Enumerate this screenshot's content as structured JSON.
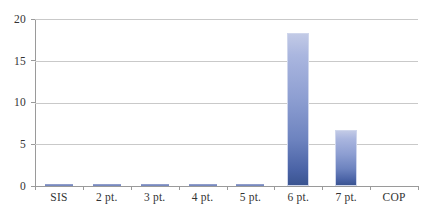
{
  "chart_data": {
    "type": "bar",
    "title": "",
    "xlabel": "",
    "ylabel": "",
    "categories": [
      "SIS",
      "2 pt.",
      "3 pt.",
      "4 pt.",
      "5 pt.",
      "6 pt.",
      "7 pt.",
      "COP"
    ],
    "values": [
      0.1,
      0.1,
      0.1,
      0.1,
      0.1,
      18.3,
      6.7,
      0
    ],
    "ylim": [
      0,
      20
    ],
    "yticks": [
      0,
      5,
      10,
      15,
      20
    ],
    "ytick_labels": [
      "0",
      "5",
      "10",
      "15",
      "20"
    ],
    "grid": true,
    "legend": "none",
    "series": [
      {
        "name": "Series 1",
        "values": [
          0.1,
          0.1,
          0.1,
          0.1,
          0.1,
          18.3,
          6.7,
          0
        ]
      }
    ],
    "colors": {
      "bar_top": "#c2cae6",
      "bar_bottom": "#3a5491",
      "gridline": "#c9c9c9",
      "axis": "#9a9a9a",
      "tick_text": "#333333",
      "background": "#ffffff"
    }
  }
}
